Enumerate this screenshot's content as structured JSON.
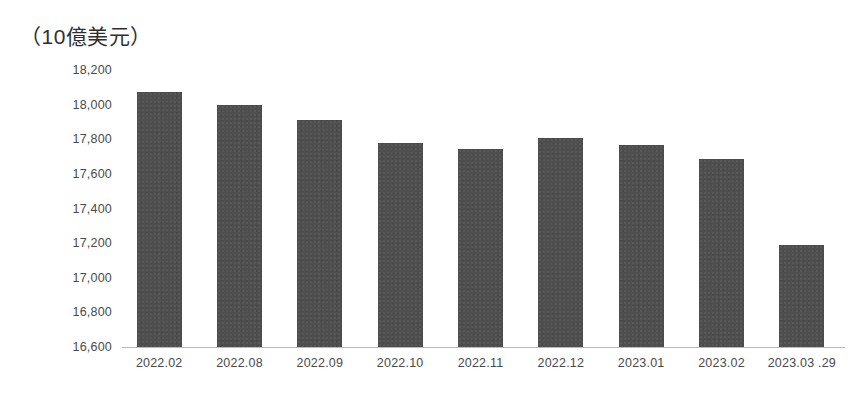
{
  "chart_data": {
    "type": "bar",
    "title": "（10億美元）",
    "subtitle": "",
    "xlabel": "",
    "ylabel": "",
    "categories": [
      "2022.02",
      "2022.08",
      "2022.09",
      "2022.10",
      "2022.11",
      "2022.12",
      "2023.01",
      "2023.02",
      "2023.03 .29"
    ],
    "values": [
      18075,
      18000,
      17910,
      17780,
      17745,
      17805,
      17765,
      17685,
      17190
    ],
    "ylim": [
      16600,
      18200
    ],
    "ytick_labels": [
      "18,200",
      "18,000",
      "17,800",
      "17,600",
      "17,400",
      "17,200",
      "17,000",
      "16,800",
      "16,600"
    ],
    "yticks": [
      18200,
      18000,
      17800,
      17600,
      17400,
      17200,
      17000,
      16800,
      16600
    ],
    "grid": false,
    "legend": null,
    "legend_position": "none",
    "bar_color": "#4e4e4e",
    "axis_color": "#b9b9b9",
    "text_color": "#4a4a4a",
    "background": "#ffffff"
  }
}
